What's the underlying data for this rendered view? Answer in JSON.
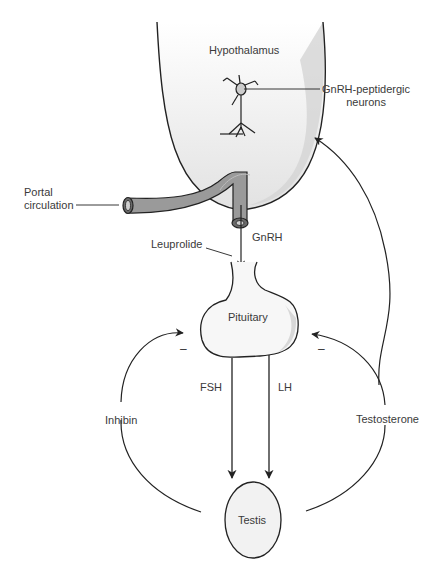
{
  "structures": {
    "hypothalamus": "Hypothalamus",
    "pituitary": "Pituitary",
    "testis": "Testis"
  },
  "labels": {
    "neurons_line1": "GnRH-peptidergic",
    "neurons_line2": "neurons",
    "portal_line1": "Portal",
    "portal_line2": "circulation",
    "leuprolide": "Leuprolide",
    "gnrh": "GnRH",
    "fsh": "FSH",
    "lh": "LH",
    "inhibin": "Inhibin",
    "testosterone": "Testosterone",
    "neg_left": "–",
    "neg_right": "–"
  },
  "colors": {
    "line": "#222222",
    "vessel_fill": "#9a9a9a",
    "shade": "#d8d8d8",
    "organ_fill": "#f2f2f2"
  }
}
